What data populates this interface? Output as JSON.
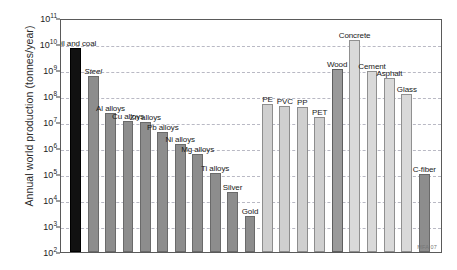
{
  "chart_data": {
    "type": "bar",
    "title": "",
    "xlabel": "",
    "ylabel": "Annual world production (tonnes/year)",
    "yscale": "log",
    "ylim": [
      100,
      100000000000
    ],
    "ytick_labels": [
      "10²",
      "10³",
      "10⁴",
      "10⁵",
      "10⁶",
      "10⁷",
      "10⁸",
      "10⁹",
      "10¹⁰",
      "10¹¹"
    ],
    "ytick_values": [
      100,
      1000,
      10000,
      100000,
      1000000,
      10000000,
      100000000,
      1000000000,
      10000000000,
      100000000000
    ],
    "grid": true,
    "legend": null,
    "annotations": [
      "MFA 07"
    ],
    "categories": [
      "Oil and coal",
      "Steel",
      "Al alloys",
      "Cu alloys",
      "Zn alloys",
      "Pb alloys",
      "Ni alloys",
      "Mg alloys",
      "Ti alloys",
      "Silver",
      "Gold",
      "PE",
      "PVC",
      "PP",
      "PET",
      "Wood",
      "Concrete",
      "Cement",
      "Asphalt",
      "Glass",
      "C-fiber"
    ],
    "values": [
      7000000000,
      600000000,
      22000000.0,
      11000000.0,
      10000000.0,
      4000000.0,
      1400000.0,
      600000.0,
      110000.0,
      20000.0,
      2500.0,
      50000000.0,
      40000000.0,
      38000000.0,
      15000000.0,
      1100000000.0,
      14000000000.0,
      900000000.0,
      500000000.0,
      120000000.0,
      100000.0
    ],
    "value_min_floor": 100,
    "series": [
      {
        "name": "Annual world production",
        "values": [
          7000000000,
          600000000,
          22000000.0,
          11000000.0,
          10000000.0,
          4000000.0,
          1400000.0,
          600000.0,
          110000.0,
          20000.0,
          2500.0,
          50000000.0,
          40000000.0,
          38000000.0,
          15000000.0,
          1100000000.0,
          14000000000.0,
          900000000.0,
          500000000.0,
          120000000.0,
          100000.0
        ]
      }
    ]
  },
  "axis": {
    "ylabel": "Annual world production (tonnes/year)",
    "ticks": [
      {
        "label_mantissa": "10",
        "label_exp": "11",
        "value": 100000000000
      },
      {
        "label_mantissa": "10",
        "label_exp": "10",
        "value": 10000000000
      },
      {
        "label_mantissa": "10",
        "label_exp": "9",
        "value": 1000000000
      },
      {
        "label_mantissa": "10",
        "label_exp": "8",
        "value": 100000000
      },
      {
        "label_mantissa": "10",
        "label_exp": "7",
        "value": 10000000
      },
      {
        "label_mantissa": "10",
        "label_exp": "6",
        "value": 1000000
      },
      {
        "label_mantissa": "10",
        "label_exp": "5",
        "value": 100000
      },
      {
        "label_mantissa": "10",
        "label_exp": "4",
        "value": 10000
      },
      {
        "label_mantissa": "10",
        "label_exp": "3",
        "value": 1000
      },
      {
        "label_mantissa": "10",
        "label_exp": "2",
        "value": 100
      }
    ]
  },
  "bars": [
    {
      "label": "Oil and coal",
      "value": 7000000000,
      "family": "fuel",
      "italic": false
    },
    {
      "label": "Steel",
      "value": 600000000,
      "family": "metal",
      "italic": true
    },
    {
      "label": "Al alloys",
      "value": 22000000,
      "family": "metal",
      "italic": false
    },
    {
      "label": "Cu alloys",
      "value": 11000000,
      "family": "metal",
      "italic": false
    },
    {
      "label": "Zn alloys",
      "value": 10000000,
      "family": "metal",
      "italic": false
    },
    {
      "label": "Pb alloys",
      "value": 4000000,
      "family": "metal",
      "italic": false
    },
    {
      "label": "Ni alloys",
      "value": 1400000,
      "family": "metal",
      "italic": false
    },
    {
      "label": "Mg alloys",
      "value": 600000,
      "family": "metal",
      "italic": false
    },
    {
      "label": "Ti alloys",
      "value": 110000,
      "family": "metal",
      "italic": false
    },
    {
      "label": "Silver",
      "value": 20000,
      "family": "metal",
      "italic": false
    },
    {
      "label": "Gold",
      "value": 2500,
      "family": "metal",
      "italic": false
    },
    {
      "label": "PE",
      "value": 50000000,
      "family": "polymer",
      "italic": false
    },
    {
      "label": "PVC",
      "value": 40000000,
      "family": "polymer",
      "italic": false
    },
    {
      "label": "PP",
      "value": 38000000,
      "family": "polymer",
      "italic": false
    },
    {
      "label": "PET",
      "value": 15000000,
      "family": "polymer",
      "italic": false
    },
    {
      "label": "Wood",
      "value": 1100000000,
      "family": "natural",
      "italic": false
    },
    {
      "label": "Concrete",
      "value": 14000000000,
      "family": "ceramic",
      "italic": false
    },
    {
      "label": "Cement",
      "value": 900000000,
      "family": "ceramic",
      "italic": false
    },
    {
      "label": "Asphalt",
      "value": 500000000,
      "family": "ceramic",
      "italic": false
    },
    {
      "label": "Glass",
      "value": 120000000,
      "family": "ceramic",
      "italic": false
    },
    {
      "label": "C-fiber",
      "value": 100000,
      "family": "composite",
      "italic": false
    }
  ],
  "watermark": "MFA 07",
  "colors": {
    "fuel": "#111111",
    "metal": "#8d8d8d",
    "polymer": "#cfcfcf",
    "natural": "#9a9a9a",
    "ceramic": "#d9d9d9",
    "composite": "#8d8d8d",
    "gridline": "#b9b9c4",
    "frame": "#5a5a5a",
    "background": "#ffffff"
  }
}
